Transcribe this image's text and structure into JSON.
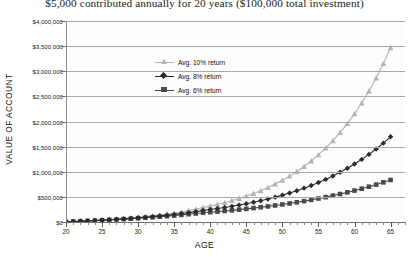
{
  "chart_data": {
    "type": "line",
    "title": "$5,000 contributed annually for 20 years ($100,000 total investment)",
    "xlabel": "AGE",
    "ylabel": "VALUE OF ACCOUNT",
    "xlim": [
      20,
      67
    ],
    "ylim": [
      0,
      4000000
    ],
    "grid": true,
    "legend_position": "upper-center-left",
    "x_ticks": [
      20,
      25,
      30,
      35,
      40,
      45,
      50,
      55,
      60,
      65
    ],
    "x_tick_labels": [
      "20",
      "25",
      "30",
      "35",
      "40",
      "45",
      "50",
      "55",
      "60",
      "65"
    ],
    "x_minor_tick_step": 1,
    "y_ticks": [
      0,
      500000,
      1000000,
      1500000,
      2000000,
      2500000,
      3000000,
      3500000,
      4000000
    ],
    "y_tick_labels": [
      "$0",
      "$500,000",
      "$1,000,000",
      "$1,500,000",
      "$2,000,000",
      "$2,500,000",
      "$3,000,000",
      "$3,500,000",
      "$4,000,000"
    ],
    "x": [
      20,
      21,
      22,
      23,
      24,
      25,
      26,
      27,
      28,
      29,
      30,
      31,
      32,
      33,
      34,
      35,
      36,
      37,
      38,
      39,
      40,
      41,
      42,
      43,
      44,
      45,
      46,
      47,
      48,
      49,
      50,
      51,
      52,
      53,
      54,
      55,
      56,
      57,
      58,
      59,
      60,
      61,
      62,
      63,
      64,
      65
    ],
    "series": [
      {
        "name": "Avg. 10% return",
        "label": "Avg. 10% return",
        "color": "#b3b3b3",
        "marker": "triangle",
        "values": [
          5000,
          10500,
          16550,
          23205,
          30526,
          38578,
          47436,
          57179,
          67897,
          79687,
          92656,
          106921,
          122613,
          139875,
          158862,
          179748,
          202723,
          227995,
          255795,
          286374,
          320012,
          352013,
          387214,
          425936,
          468529,
          515382,
          566920,
          623612,
          685974,
          754571,
          830028,
          913031,
          1004334,
          1104767,
          1215244,
          1336769,
          1470445,
          1617490,
          1779239,
          1957163,
          2152879,
          2368167,
          2604984,
          2865482,
          3152030,
          3467233
        ]
      },
      {
        "name": "Avg. 8% return",
        "label": "Avg. 8% return",
        "color": "#2b2b2b",
        "marker": "diamond",
        "values": [
          5000,
          10400,
          16232,
          22531,
          29333,
          36680,
          44614,
          53183,
          62438,
          72433,
          83227,
          94885,
          107476,
          121074,
          135760,
          151621,
          168751,
          187251,
          207231,
          228810,
          247515,
          267316,
          288701,
          311797,
          336741,
          363680,
          392774,
          424196,
          458132,
          494782,
          534365,
          577114,
          623283,
          673146,
          726998,
          785158,
          847970,
          915808,
          989073,
          1068199,
          1153655,
          1245947,
          1345623,
          1453273,
          1569535,
          1695098
        ]
      },
      {
        "name": "Avg. 6% return",
        "label": "Avg. 6% return",
        "color": "#4a4a4a",
        "marker": "square",
        "values": [
          5000,
          10300,
          15918,
          21873,
          28185,
          34877,
          41970,
          49488,
          57457,
          65905,
          74859,
          84351,
          94412,
          105077,
          116381,
          128364,
          141066,
          154530,
          168801,
          183929,
          194965,
          206663,
          219063,
          232207,
          246139,
          260907,
          276562,
          293156,
          310745,
          329390,
          349153,
          370102,
          392308,
          415847,
          440798,
          467246,
          495281,
          524998,
          556498,
          589887,
          625281,
          662798,
          702565,
          744719,
          789402,
          836767
        ]
      }
    ]
  }
}
